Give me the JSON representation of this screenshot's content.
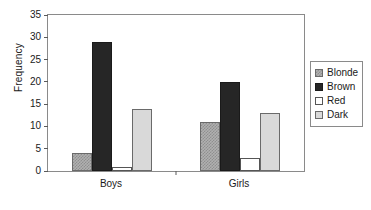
{
  "chart_data": {
    "type": "bar",
    "title": "",
    "xlabel": "",
    "ylabel": "Frequency",
    "categories": [
      "Boys",
      "Girls"
    ],
    "series": [
      {
        "name": "Blonde",
        "values": [
          4,
          11
        ],
        "color": "#b0b0b0",
        "pattern": "checkered"
      },
      {
        "name": "Brown",
        "values": [
          29,
          20
        ],
        "color": "#262626",
        "pattern": "solid"
      },
      {
        "name": "Red",
        "values": [
          1,
          3
        ],
        "color": "#ffffff",
        "pattern": "solid"
      },
      {
        "name": "Dark",
        "values": [
          14,
          13
        ],
        "color": "#d9d9d9",
        "pattern": "solid"
      }
    ],
    "ylim": [
      0,
      35
    ],
    "ytick_labels": [
      "0",
      "5",
      "10",
      "15",
      "20",
      "25",
      "30",
      "35"
    ],
    "ytick_values": [
      0,
      5,
      10,
      15,
      20,
      25,
      30,
      35
    ],
    "grid": false,
    "legend_position": "right"
  },
  "legend": {
    "entries": [
      {
        "label": "Blonde"
      },
      {
        "label": "Brown"
      },
      {
        "label": "Red"
      },
      {
        "label": "Dark"
      }
    ]
  }
}
